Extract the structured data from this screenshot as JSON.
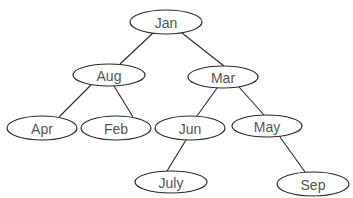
{
  "diagram": {
    "type": "binary-search-tree",
    "nodes": [
      {
        "id": "jan",
        "label": "Jan",
        "cx": 166,
        "cy": 22,
        "rx": 36,
        "ry": 12
      },
      {
        "id": "aug",
        "label": "Aug",
        "cx": 109,
        "cy": 75,
        "rx": 36,
        "ry": 11
      },
      {
        "id": "mar",
        "label": "Mar",
        "cx": 223,
        "cy": 77,
        "rx": 35,
        "ry": 11
      },
      {
        "id": "apr",
        "label": "Apr",
        "cx": 42,
        "cy": 128,
        "rx": 35,
        "ry": 12
      },
      {
        "id": "feb",
        "label": "Feb",
        "cx": 116,
        "cy": 128,
        "rx": 35,
        "ry": 12
      },
      {
        "id": "jun",
        "label": "Jun",
        "cx": 190,
        "cy": 128,
        "rx": 35,
        "ry": 12
      },
      {
        "id": "may",
        "label": "May",
        "cx": 267,
        "cy": 126,
        "rx": 35,
        "ry": 11
      },
      {
        "id": "july",
        "label": "July",
        "cx": 171,
        "cy": 182,
        "rx": 36,
        "ry": 11
      },
      {
        "id": "sep",
        "label": "Sep",
        "cx": 313,
        "cy": 184,
        "rx": 36,
        "ry": 12
      }
    ],
    "edges": [
      {
        "from": "jan",
        "to": "aug",
        "x1": 153,
        "y1": 33,
        "x2": 120,
        "y2": 64
      },
      {
        "from": "jan",
        "to": "mar",
        "x1": 182,
        "y1": 33,
        "x2": 224,
        "y2": 66
      },
      {
        "from": "aug",
        "to": "apr",
        "x1": 91,
        "y1": 85,
        "x2": 59,
        "y2": 117
      },
      {
        "from": "aug",
        "to": "feb",
        "x1": 114,
        "y1": 86,
        "x2": 133,
        "y2": 117
      },
      {
        "from": "mar",
        "to": "jun",
        "x1": 217,
        "y1": 88,
        "x2": 197,
        "y2": 116
      },
      {
        "from": "mar",
        "to": "may",
        "x1": 239,
        "y1": 87,
        "x2": 264,
        "y2": 115
      },
      {
        "from": "jun",
        "to": "july",
        "x1": 186,
        "y1": 140,
        "x2": 167,
        "y2": 171
      },
      {
        "from": "may",
        "to": "sep",
        "x1": 280,
        "y1": 137,
        "x2": 305,
        "y2": 172
      }
    ],
    "colors": {
      "stroke": "#2a2a2a",
      "text": "#555555",
      "background": "#ffffff"
    }
  }
}
